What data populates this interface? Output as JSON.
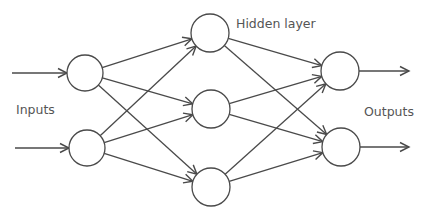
{
  "diagram": {
    "type": "neural-network",
    "labels": {
      "inputs": "Inputs",
      "hidden": "Hidden layer",
      "outputs": "Outputs"
    },
    "colors": {
      "stroke": "#4a4a4a",
      "node_fill": "#ffffff",
      "text": "#555555",
      "background": "#ffffff"
    },
    "layers": [
      {
        "name": "input",
        "nodes": [
          {
            "id": "i1",
            "cx": 85,
            "cy": 73,
            "r": 18
          },
          {
            "id": "i2",
            "cx": 87,
            "cy": 148,
            "r": 18
          }
        ]
      },
      {
        "name": "hidden",
        "nodes": [
          {
            "id": "h1",
            "cx": 210,
            "cy": 33,
            "r": 19
          },
          {
            "id": "h2",
            "cx": 211,
            "cy": 109,
            "r": 19
          },
          {
            "id": "h3",
            "cx": 211,
            "cy": 187,
            "r": 19
          }
        ]
      },
      {
        "name": "output",
        "nodes": [
          {
            "id": "o1",
            "cx": 340,
            "cy": 71,
            "r": 19
          },
          {
            "id": "o2",
            "cx": 341,
            "cy": 147,
            "r": 19
          }
        ]
      }
    ],
    "input_arrows": [
      {
        "x1": 12,
        "y1": 73,
        "to": "i1"
      },
      {
        "x1": 15,
        "y1": 148,
        "to": "i2"
      }
    ],
    "output_arrows": [
      {
        "from": "o1",
        "x2": 409,
        "y2": 71
      },
      {
        "from": "o2",
        "x2": 409,
        "y2": 147
      }
    ],
    "edges": [
      [
        "i1",
        "h1"
      ],
      [
        "i1",
        "h2"
      ],
      [
        "i1",
        "h3"
      ],
      [
        "i2",
        "h1"
      ],
      [
        "i2",
        "h2"
      ],
      [
        "i2",
        "h3"
      ],
      [
        "h1",
        "o1"
      ],
      [
        "h1",
        "o2"
      ],
      [
        "h2",
        "o1"
      ],
      [
        "h2",
        "o2"
      ],
      [
        "h3",
        "o1"
      ],
      [
        "h3",
        "o2"
      ]
    ]
  }
}
